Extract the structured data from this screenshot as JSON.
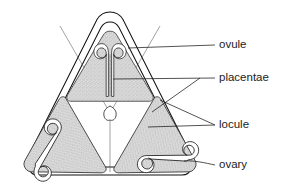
{
  "figure": {
    "name": "ovary-transverse-section",
    "title": ""
  },
  "colors": {
    "outline": "#111111",
    "tissue_stroke": "#2a2a2a",
    "stipple_fill": "#d9d9d9",
    "stipple_dot": "#6e6e6e",
    "background": "#ffffff",
    "label_text": "#1c1c1c",
    "leader_line": "#1a1a1a"
  },
  "labels": [
    {
      "id": "ovule",
      "text": "ovule",
      "x": 219,
      "y": 45,
      "leader": {
        "x1": 128,
        "y1": 48,
        "x2": 215,
        "y2": 45
      }
    },
    {
      "id": "placentae",
      "text": "placentae",
      "x": 219,
      "y": 78,
      "leader": {
        "x1": 113,
        "y1": 79,
        "x2": 215,
        "y2": 78
      }
    },
    {
      "id": "locule",
      "text": "locule",
      "x": 219,
      "y": 125,
      "leader": {
        "x1": 148,
        "y1": 127,
        "x2": 215,
        "y2": 125
      }
    },
    {
      "id": "ovary",
      "text": "ovary",
      "x": 219,
      "y": 165,
      "leader": {
        "x1": 184,
        "y1": 161,
        "x2": 215,
        "y2": 165
      }
    }
  ],
  "structures": [
    {
      "id": "locule-top",
      "name": "locule",
      "position": "top"
    },
    {
      "id": "locule-bottom-left",
      "name": "locule",
      "position": "bottom-left"
    },
    {
      "id": "locule-bottom-right",
      "name": "locule",
      "position": "bottom-right"
    },
    {
      "id": "placenta-top",
      "name": "placenta",
      "position": "top"
    },
    {
      "id": "placenta-bottom-left",
      "name": "placenta",
      "position": "bottom-left"
    },
    {
      "id": "placenta-bottom-right",
      "name": "placenta",
      "position": "bottom-right"
    },
    {
      "id": "ovule-top-left",
      "name": "ovule",
      "position": "top-left"
    },
    {
      "id": "ovule-top-right",
      "name": "ovule",
      "position": "top-right"
    },
    {
      "id": "ovule-bl-upper",
      "name": "ovule",
      "position": "bottom-left-upper"
    },
    {
      "id": "ovule-bl-lower",
      "name": "ovule",
      "position": "bottom-left-lower"
    },
    {
      "id": "ovule-br-upper",
      "name": "ovule",
      "position": "bottom-right-upper"
    },
    {
      "id": "ovule-br-lower",
      "name": "ovule",
      "position": "bottom-right-lower"
    },
    {
      "id": "ovary-wall",
      "name": "ovary wall",
      "position": "perimeter"
    }
  ]
}
